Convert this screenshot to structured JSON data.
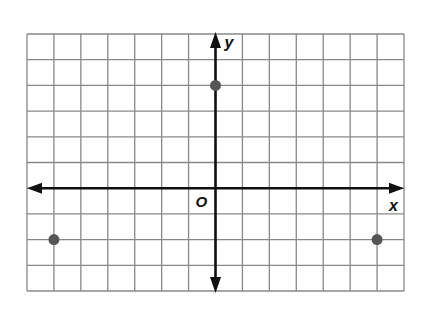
{
  "chart_data": {
    "type": "scatter",
    "title": "",
    "xlabel": "x",
    "ylabel": "y",
    "origin_label": "O",
    "xlim": [
      -7,
      7
    ],
    "ylim": [
      -4,
      6
    ],
    "grid": true,
    "grid_step": 1,
    "tick_labels": false,
    "points": [
      {
        "x": 0,
        "y": 4
      },
      {
        "x": -6,
        "y": -2
      },
      {
        "x": 6,
        "y": -2
      }
    ],
    "point_color": "#555555",
    "grid_color": "#888888",
    "axis_color": "#111111"
  }
}
